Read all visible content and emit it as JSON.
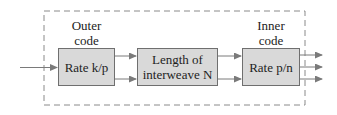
{
  "diagram": {
    "outer_label": {
      "line1": "Outer",
      "line2": "code"
    },
    "inner_label": {
      "line1": "Inner",
      "line2": "code"
    },
    "blocks": [
      {
        "id": "outer-encoder",
        "label": "Rate k/p"
      },
      {
        "id": "interleaver",
        "line1": "Length of",
        "line2": "interweave N"
      },
      {
        "id": "inner-encoder",
        "label": "Rate p/n"
      }
    ],
    "edges": [
      {
        "from": "input",
        "to": "outer-encoder",
        "count": 1
      },
      {
        "from": "outer-encoder",
        "to": "interleaver",
        "count": 2
      },
      {
        "from": "interleaver",
        "to": "inner-encoder",
        "count": 2
      },
      {
        "from": "inner-encoder",
        "to": "output",
        "count": 3
      }
    ],
    "colors": {
      "block_fill": "#d9d9d9",
      "block_border": "#6f6f6f",
      "arrow": "#7a7a7a",
      "dashed_border": "#8a8a8a"
    }
  }
}
